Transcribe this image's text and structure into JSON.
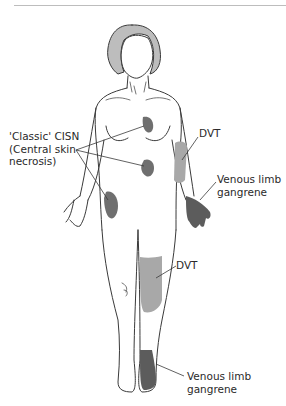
{
  "figure": {
    "colors": {
      "outline": "#3a3a3a",
      "hair": "#bdbdbd",
      "necrosis_dark": "#6f6f6f",
      "dvt_light": "#a8a8a8",
      "gangrene_dark": "#5c5c5c",
      "background": "#ffffff",
      "rule": "#bdbdbd"
    },
    "labels": {
      "cisn_line1": "'Classic' CISN",
      "cisn_line2": "(Central skin",
      "cisn_line3": "necrosis)",
      "dvt_arm": "DVT",
      "vlg_hand_line1": "Venous limb",
      "vlg_hand_line2": "gangrene",
      "dvt_leg": "DVT",
      "vlg_foot_line1": "Venous limb",
      "vlg_foot_line2": "gangrene"
    }
  }
}
